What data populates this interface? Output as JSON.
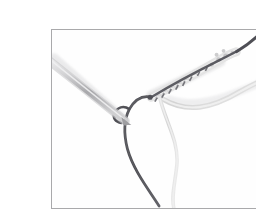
{
  "figure": {
    "name": "crochet-technique-photo",
    "alt_text": "Close-up photograph of a crochet hook with a dark thread and a light thread forming a braided chain",
    "border_color": "#a9a9ab",
    "background_color": "#ffffff",
    "canvas_background": "#fefefe",
    "frame": {
      "x": 11,
      "y": 13,
      "width": 236,
      "height": 180
    }
  },
  "palette": {
    "hook_light": "#d8d8da",
    "hook_mid": "#b4b4b6",
    "hook_dark": "#8f8f92",
    "dark_thread": "#55555a",
    "dark_thread_soft": "#76767c",
    "light_thread": "#dcdcdc",
    "light_thread_soft": "#ececec",
    "braid_light": "#e2e2e2",
    "braid_shadow": "#bdbdbf",
    "tuft_dark": "#6a6a70",
    "shadow": "#cfcfd1"
  },
  "objects": [
    {
      "name": "crochet-hook",
      "label": "Crochet hook",
      "description": "Metallic gray shaft entering from the left edge and angling down-right to a pointed tip",
      "start": [
        0,
        36
      ],
      "tip": [
        78,
        94
      ],
      "width": 6.5
    },
    {
      "name": "dark-thread",
      "label": "Dark working thread",
      "description": "Dark gray cord wrapping the hook tip, running right through the braid and exiting the top-right edge, with a long tail falling to the bottom",
      "color": "#55555a",
      "exit_top_right": [
        222,
        0
      ],
      "tail_end": [
        118,
        178
      ]
    },
    {
      "name": "light-thread",
      "label": "Light thread",
      "description": "Pale cream cord leaving the braid and curving down-right to the right edge, with a second tail falling toward the bottom center",
      "color": "#dcdcdc",
      "exit_right": [
        236,
        44
      ],
      "tail_end": [
        125,
        182
      ]
    },
    {
      "name": "braided-chain",
      "label": "Braided chain section",
      "description": "Textured light braid with small dark tufts running diagonally up-right from the hook tip",
      "start": [
        104,
        64
      ],
      "end": [
        172,
        30
      ]
    }
  ]
}
